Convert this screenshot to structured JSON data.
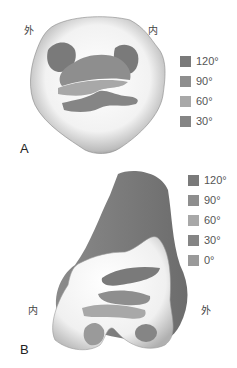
{
  "panel_a": {
    "letter": "A",
    "label_left": "外",
    "label_right": "内",
    "legend": [
      {
        "label": "120°",
        "color": "#7a7a7a"
      },
      {
        "label": "90°",
        "color": "#8e8e8e"
      },
      {
        "label": "60°",
        "color": "#a8a8a8"
      },
      {
        "label": "30°",
        "color": "#858585"
      }
    ]
  },
  "panel_b": {
    "letter": "B",
    "label_left": "内",
    "label_right": "外",
    "legend": [
      {
        "label": "120°",
        "color": "#7a7a7a"
      },
      {
        "label": "90°",
        "color": "#8e8e8e"
      },
      {
        "label": "60°",
        "color": "#a8a8a8"
      },
      {
        "label": "30°",
        "color": "#858585"
      },
      {
        "label": "0°",
        "color": "#9a9a9a"
      }
    ]
  }
}
